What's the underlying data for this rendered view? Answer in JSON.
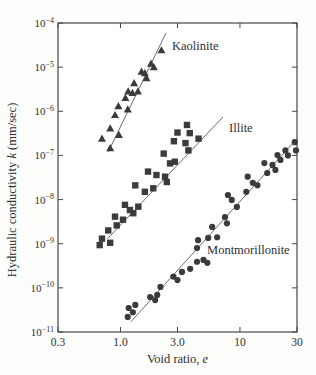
{
  "figure": {
    "background": "#fdfdfc",
    "ink_color": "#2e2e2e",
    "marker_color": "#3b3b3b",
    "fit_line_color": "#6b6b6b",
    "frame_color": "#474747"
  },
  "chart_data": {
    "type": "scatter",
    "x_scale": "log",
    "y_scale": "log",
    "xlim": [
      0.3,
      30
    ],
    "ylim": [
      1e-11,
      0.0001
    ],
    "grid": false,
    "legend_position": "inline-labels",
    "xlabel": "Void ratio, e",
    "ylabel": "Hydraulic conductivity k (mm/sec)",
    "xlabel_parts": [
      {
        "t": "Void ratio, ",
        "i": false
      },
      {
        "t": "e",
        "i": true
      }
    ],
    "ylabel_parts": [
      {
        "t": "Hydraulic conductivity ",
        "i": false
      },
      {
        "t": "k",
        "i": true
      },
      {
        "t": " (mm/sec)",
        "i": false
      }
    ],
    "x_ticks": [
      {
        "v": 0.3,
        "label": "0.3"
      },
      {
        "v": 1.0,
        "label": "1.0"
      },
      {
        "v": 3.0,
        "label": "3.0"
      },
      {
        "v": 10,
        "label": "10"
      },
      {
        "v": 30,
        "label": "30"
      }
    ],
    "y_ticks": [
      {
        "v": 0.0001,
        "base": "10",
        "exp": "−4"
      },
      {
        "v": 1e-05,
        "base": "10",
        "exp": "−5"
      },
      {
        "v": 1e-06,
        "base": "10",
        "exp": "−6"
      },
      {
        "v": 1e-07,
        "base": "10",
        "exp": "−7"
      },
      {
        "v": 1e-08,
        "base": "10",
        "exp": "−8"
      },
      {
        "v": 1e-09,
        "base": "10",
        "exp": "−9"
      },
      {
        "v": 1e-10,
        "base": "10",
        "exp": "−10"
      },
      {
        "v": 1e-11,
        "base": "10",
        "exp": "−11"
      }
    ],
    "series": [
      {
        "name": "Kaolinite",
        "marker": "triangle",
        "label": {
          "text": "Kaolinite",
          "e": 2.7,
          "k": 3e-05
        },
        "fit_line": [
          [
            0.79,
            1.2e-07
          ],
          [
            2.4,
            5.9e-05
          ]
        ],
        "points": [
          [
            2.2,
            2.4e-05
          ],
          [
            1.8,
            1.2e-05
          ],
          [
            1.9,
            1e-05
          ],
          [
            1.5,
            7.9e-06
          ],
          [
            1.6,
            7.3e-06
          ],
          [
            1.65,
            5.6e-06
          ],
          [
            1.3,
            4.3e-06
          ],
          [
            1.16,
            2.8e-06
          ],
          [
            1.4,
            2.8e-06
          ],
          [
            1.26,
            2.6e-06
          ],
          [
            1.1,
            2e-06
          ],
          [
            0.96,
            1.3e-06
          ],
          [
            1.15,
            1.1e-06
          ],
          [
            0.9,
            8.2e-07
          ],
          [
            0.82,
            4.1e-07
          ],
          [
            0.97,
            2.9e-07
          ],
          [
            0.7,
            2.4e-07
          ],
          [
            0.82,
            1.45e-07
          ]
        ]
      },
      {
        "name": "Illite",
        "marker": "square",
        "label": {
          "text": "Illite",
          "e": 8.1,
          "k": 4.2e-07
        },
        "fit_line": [
          [
            0.78,
            1.3e-09
          ],
          [
            7.2,
            7.4e-07
          ]
        ],
        "points": [
          [
            3.6,
            4.9e-07
          ],
          [
            3.0,
            3.3e-07
          ],
          [
            3.8,
            3.2e-07
          ],
          [
            4.5,
            2.4e-07
          ],
          [
            2.8,
            2.1e-07
          ],
          [
            3.5,
            1.9e-07
          ],
          [
            3.7,
            1.3e-07
          ],
          [
            2.3,
            1.1e-07
          ],
          [
            2.85,
            7.2e-08
          ],
          [
            2.6,
            6.6e-08
          ],
          [
            1.7,
            4.3e-08
          ],
          [
            2.0,
            3.6e-08
          ],
          [
            2.36,
            3.3e-08
          ],
          [
            2.44,
            2.5e-08
          ],
          [
            1.33,
            2.1e-08
          ],
          [
            1.88,
            1.8e-08
          ],
          [
            1.6,
            1.5e-08
          ],
          [
            1.09,
            7.6e-09
          ],
          [
            1.41,
            6.9e-09
          ],
          [
            1.2,
            5.8e-09
          ],
          [
            1.28,
            4.9e-09
          ],
          [
            0.9,
            4.1e-09
          ],
          [
            1.05,
            3.5e-09
          ],
          [
            0.93,
            2.6e-09
          ],
          [
            0.79,
            2e-09
          ],
          [
            0.7,
            1.3e-09
          ],
          [
            0.82,
            1.05e-09
          ],
          [
            0.67,
            9.3e-10
          ]
        ]
      },
      {
        "name": "Montmorillonite",
        "marker": "circle",
        "label": {
          "text": "Montmorillonite",
          "e": 5.3,
          "k": 7.2e-10
        },
        "fit_line": [
          [
            1.22,
            1.7e-11
          ],
          [
            30,
            2.4e-07
          ]
        ],
        "points": [
          [
            1.15,
            2.2e-11
          ],
          [
            1.17,
            3.5e-11
          ],
          [
            1.27,
            2.8e-11
          ],
          [
            1.33,
            4.1e-11
          ],
          [
            1.77,
            6.2e-11
          ],
          [
            1.95,
            5.3e-11
          ],
          [
            2.03,
            6.9e-11
          ],
          [
            2.16,
            1.05e-10
          ],
          [
            2.77,
            1.8e-10
          ],
          [
            3.0,
            1.5e-10
          ],
          [
            3.27,
            2.3e-10
          ],
          [
            3.83,
            2.7e-10
          ],
          [
            4.37,
            3.9e-10
          ],
          [
            4.95,
            4.3e-10
          ],
          [
            5.33,
            3.7e-10
          ],
          [
            4.37,
            8e-10
          ],
          [
            4.46,
            1.2e-09
          ],
          [
            5.42,
            1.35e-09
          ],
          [
            6.44,
            1.4e-09
          ],
          [
            5.85,
            2.4e-09
          ],
          [
            7.49,
            4e-09
          ],
          [
            7.78,
            2.9e-09
          ],
          [
            7.93,
            1.27e-08
          ],
          [
            8.54,
            9.8e-09
          ],
          [
            9.42,
            6.8e-09
          ],
          [
            11.3,
            1.5e-08
          ],
          [
            11.6,
            3.3e-08
          ],
          [
            12.8,
            2.4e-08
          ],
          [
            14.0,
            2.1e-08
          ],
          [
            16.0,
            6.7e-08
          ],
          [
            16.9,
            4e-08
          ],
          [
            18.7,
            6.1e-08
          ],
          [
            19.8,
            4.7e-08
          ],
          [
            20.6,
            1.02e-07
          ],
          [
            21.8,
            7.9e-08
          ],
          [
            24.0,
            1.3e-07
          ],
          [
            25.2,
            1e-07
          ],
          [
            28.7,
            2e-07
          ],
          [
            29.4,
            1.3e-07
          ]
        ]
      }
    ]
  }
}
